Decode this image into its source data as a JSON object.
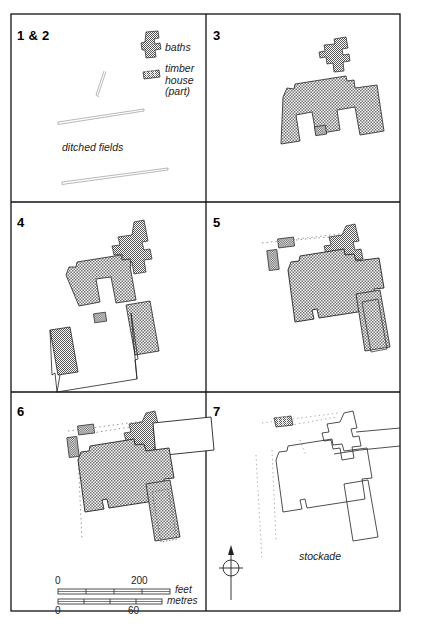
{
  "figure": {
    "frame_color": "#111111",
    "hatch_color": "#8c8c8c",
    "outline_color": "#222222"
  },
  "panels": [
    {
      "id": "p12",
      "number": "1 & 2"
    },
    {
      "id": "p3",
      "number": "3"
    },
    {
      "id": "p4",
      "number": "4"
    },
    {
      "id": "p5",
      "number": "5"
    },
    {
      "id": "p6",
      "number": "6"
    },
    {
      "id": "p7",
      "number": "7"
    }
  ],
  "legend": {
    "baths_label": "baths",
    "timber_house_label": "timber\nhouse\n(part)"
  },
  "annotations": {
    "ditched_fields": "ditched fields",
    "stockade": "stockade"
  },
  "scale_bars": [
    {
      "id": "feet",
      "unit_label": "feet",
      "min_label": "0",
      "max_label": "200",
      "min_value": 0,
      "max_value": 200,
      "label_position": "above"
    },
    {
      "id": "metres",
      "unit_label": "metres",
      "min_label": "0",
      "max_label": "60",
      "min_value": 0,
      "max_value": 60,
      "label_position": "below"
    }
  ],
  "compass": {
    "name": "north-arrow",
    "direction": "north"
  }
}
